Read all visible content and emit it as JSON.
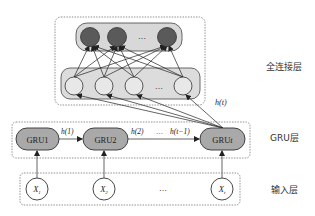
{
  "layers": {
    "fc": {
      "label": "全连接层",
      "output_nodes": [
        "",
        "",
        "",
        ""
      ],
      "output_ellipsis": "…",
      "hidden_ellipsis": "…"
    },
    "gru": {
      "label": "GRU层",
      "cells": [
        {
          "label": "GRU1"
        },
        {
          "label": "GRU2"
        },
        {
          "label_main": "GRU",
          "label_italic": "t"
        }
      ],
      "edges": {
        "h1": "h(1)",
        "h2": "h(2)",
        "ellipsis": "…",
        "ht_minus_1": "h(t−1)",
        "ht": "h(t)"
      }
    },
    "input": {
      "label": "输入层",
      "nodes": [
        {
          "main": "X",
          "sub": "1"
        },
        {
          "main": "X",
          "sub": "2"
        },
        {
          "main": "X",
          "sub": "t"
        }
      ],
      "ellipsis": "…"
    }
  },
  "colors": {
    "dark_node": "#5a5a5a",
    "dark_node_ring": "#3a3a3a",
    "group_fill": "#dcdcdc",
    "gru_fill": "#a9a9a9",
    "light_node": "#e6e6e6",
    "stroke": "#222222",
    "dashed": "#777777"
  }
}
